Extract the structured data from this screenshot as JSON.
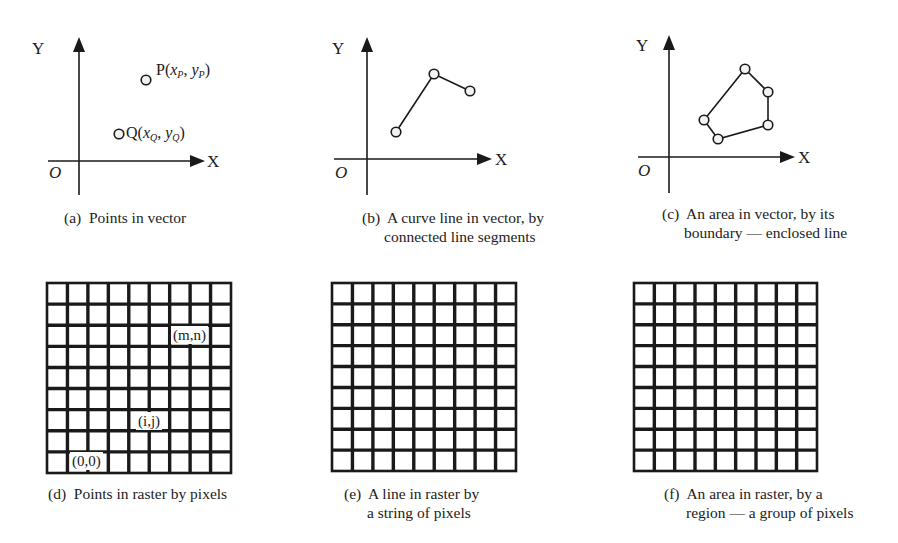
{
  "figure": {
    "panels": [
      {
        "id": "a",
        "type": "vector-points",
        "caption_tag": "(a)",
        "caption_line1": "Points in vector",
        "caption_line2": "",
        "axes": {
          "x_label": "X",
          "y_label": "Y",
          "origin_label": "O",
          "origin": [
            79,
            161
          ],
          "y_top": 37,
          "y_bottom": 195,
          "x_left": 48,
          "x_right": 205
        },
        "points": [
          {
            "name": "P",
            "label": "P",
            "sub_x": "P",
            "sub_y": "P",
            "xy": [
              146,
              80
            ]
          },
          {
            "name": "Q",
            "label": "Q",
            "sub_x": "Q",
            "sub_y": "Q",
            "xy": [
              119,
              134
            ]
          }
        ]
      },
      {
        "id": "b",
        "type": "vector-line",
        "caption_tag": "(b)",
        "caption_line1": "A curve line in vector, by",
        "caption_line2": "connected line segments",
        "axes": {
          "x_label": "X",
          "y_label": "Y",
          "origin_label": "O",
          "origin": [
            367,
            159
          ],
          "y_top": 37,
          "y_bottom": 195,
          "x_left": 334,
          "x_right": 492
        },
        "vertices": [
          [
            396,
            132
          ],
          [
            434,
            74
          ],
          [
            470,
            91
          ]
        ]
      },
      {
        "id": "c",
        "type": "vector-area",
        "caption_tag": "(c)",
        "caption_line1": "An area in vector, by its",
        "caption_line2": "boundary — enclosed line",
        "axes": {
          "x_label": "X",
          "y_label": "Y",
          "origin_label": "O",
          "origin": [
            669,
            157
          ],
          "y_top": 35,
          "y_bottom": 193,
          "x_left": 638,
          "x_right": 795
        },
        "vertices": [
          [
            745,
            69
          ],
          [
            768,
            92
          ],
          [
            768,
            125
          ],
          [
            718,
            139
          ],
          [
            704,
            120
          ]
        ]
      },
      {
        "id": "d",
        "type": "raster-points",
        "caption_tag": "(d)",
        "caption_line1": "Points in raster by pixels",
        "caption_line2": "",
        "grid": {
          "x": 47,
          "y": 283,
          "width": 184,
          "height": 190,
          "cols": 9,
          "rows": 9
        },
        "labels": [
          {
            "text": "(m,n)",
            "x": 171,
            "y": 326
          },
          {
            "text": "(i,j)",
            "x": 136,
            "y": 412
          },
          {
            "text": "(0,0)",
            "x": 70,
            "y": 452
          }
        ]
      },
      {
        "id": "e",
        "type": "raster-line",
        "caption_tag": "(e)",
        "caption_line1": "A line in raster by",
        "caption_line2": "a string of pixels",
        "grid": {
          "x": 332,
          "y": 283,
          "width": 184,
          "height": 188,
          "cols": 9,
          "rows": 9
        }
      },
      {
        "id": "f",
        "type": "raster-area",
        "caption_tag": "(f)",
        "caption_line1": "An area in raster, by a",
        "caption_line2": "region — a group of pixels",
        "grid": {
          "x": 634,
          "y": 283,
          "width": 183,
          "height": 188,
          "cols": 9,
          "rows": 9
        }
      }
    ],
    "colors": {
      "ink": "#1a1a1a",
      "point_fill": "#f2f2f2",
      "background": "#ffffff"
    }
  }
}
